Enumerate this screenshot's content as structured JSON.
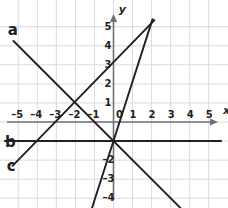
{
  "figure": {
    "type": "line-graph",
    "title": "",
    "background": "#ffffff",
    "grid_color": "#d9d9de",
    "axis_color": "#6f6f76",
    "curve_color": "#231f20",
    "text_color": "#231f20"
  },
  "axes": {
    "x_label": "x",
    "y_label": "y",
    "xlim": [
      -5.7,
      5.9
    ],
    "ylim": [
      -5.0,
      5.9
    ],
    "x_ticks": [
      -5,
      -4,
      -3,
      -2,
      -1,
      0,
      1,
      2,
      3,
      4,
      5
    ],
    "x_tick_labels": [
      "–5",
      "–4",
      "–3",
      "–2",
      "–1",
      "0",
      "1",
      "2",
      "3",
      "4",
      "5"
    ],
    "y_ticks": [
      5,
      4,
      3,
      2,
      1,
      -2,
      -3,
      -4
    ],
    "y_tick_labels": [
      "5",
      "4",
      "3",
      "2",
      "1",
      "–2",
      "–3",
      "–4"
    ],
    "origin_label": "0",
    "grid": true,
    "x_arrow": true,
    "y_arrow": true
  },
  "chart_data": {
    "type": "line",
    "title": "",
    "xlabel": "x",
    "ylabel": "y",
    "xlim": [
      -5.7,
      5.9
    ],
    "ylim": [
      -5.0,
      5.9
    ],
    "grid": true,
    "legend": "inline-labels",
    "series": [
      {
        "name": "a",
        "label": "a",
        "label_x": -5.55,
        "label_y": 4.85,
        "slope": -1.0,
        "intercept": -1.0,
        "equation": "y = –x – 1",
        "points": [
          [
            -5.25,
            4.25
          ],
          [
            4.35,
            -5.35
          ]
        ]
      },
      {
        "name": "b",
        "label": "b",
        "label_x": -5.7,
        "label_y": -1.05,
        "slope": 0.0,
        "intercept": -1.0,
        "equation": "y = –1",
        "points": [
          [
            -5.7,
            -1.0
          ],
          [
            5.65,
            -1.0
          ]
        ]
      },
      {
        "name": "c",
        "label": "c",
        "label_x": -5.6,
        "label_y": -2.3,
        "slope": 1.0,
        "intercept": 3.0,
        "equation": "y = x + 3",
        "points": [
          [
            -5.3,
            -2.3
          ],
          [
            2.15,
            5.35
          ]
        ]
      },
      {
        "name": "d",
        "label": "",
        "label_x": null,
        "label_y": null,
        "slope": 3.2,
        "intercept": -1.0,
        "equation": "y = 3x – 1",
        "points": [
          [
            -1.3,
            -5.05
          ],
          [
            2.05,
            5.4
          ]
        ]
      }
    ]
  },
  "labels": {
    "line_a": "a",
    "line_b": "b",
    "line_c": "c"
  }
}
